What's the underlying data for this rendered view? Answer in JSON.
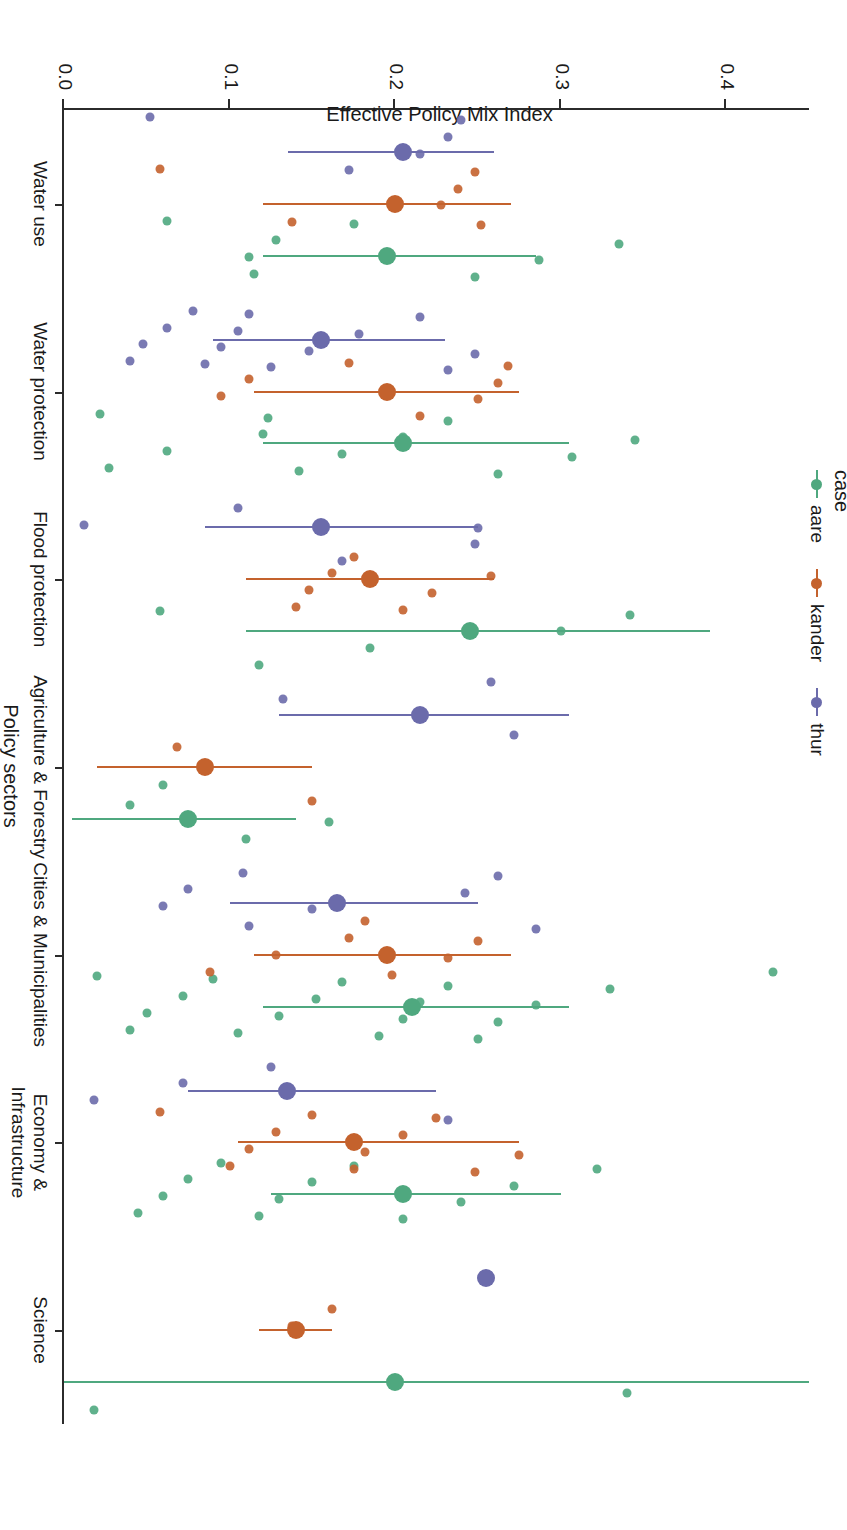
{
  "figure": {
    "xaxis_title": "Policy sectors",
    "yaxis_title": "Effective Policy Mix Index",
    "ytick_labels": [
      "0.4",
      "0.3",
      "0.2",
      "0.1",
      "0.0"
    ],
    "ytick_values": [
      0.4,
      0.3,
      0.2,
      0.1,
      0.0
    ]
  },
  "legend": {
    "title": "case",
    "items": [
      {
        "label": "aare",
        "color": "#4fa87f"
      },
      {
        "label": "kander",
        "color": "#c4622d"
      },
      {
        "label": "thur",
        "color": "#6b6bab"
      }
    ]
  },
  "chart_data": {
    "type": "scatter",
    "title": "",
    "xlabel": "Policy sectors",
    "ylabel": "Effective Policy Mix Index",
    "ylim": [
      0.0,
      0.45
    ],
    "grid": false,
    "legend_position": "left",
    "legend_title": "case",
    "categories": [
      "Water use",
      "Water protection",
      "Flood protection",
      "Agriculture & Forestry",
      "Cities & Municipalities",
      "Economy & Infrastructure",
      "Science"
    ],
    "series": [
      {
        "name": "aare",
        "color": "#4fa87f",
        "means": [
          0.195,
          0.205,
          0.245,
          0.075,
          0.21,
          0.205,
          0.2
        ],
        "ci_low": [
          0.12,
          0.12,
          0.11,
          0.005,
          0.12,
          0.125,
          0.0
        ],
        "ci_high": [
          0.285,
          0.305,
          0.39,
          0.14,
          0.305,
          0.3,
          0.45
        ]
      },
      {
        "name": "kander",
        "color": "#c4622d",
        "means": [
          0.2,
          0.195,
          0.185,
          0.085,
          0.195,
          0.175,
          0.14
        ],
        "ci_low": [
          0.12,
          0.115,
          0.11,
          0.02,
          0.115,
          0.105,
          0.118
        ],
        "ci_high": [
          0.27,
          0.275,
          0.26,
          0.15,
          0.27,
          0.275,
          0.162
        ]
      },
      {
        "name": "thur",
        "color": "#6b6bab",
        "means": [
          0.205,
          0.155,
          0.155,
          0.215,
          0.165,
          0.135,
          0.255
        ],
        "ci_low": [
          0.135,
          0.09,
          0.085,
          0.13,
          0.1,
          0.075,
          0.255
        ],
        "ci_high": [
          0.26,
          0.23,
          0.25,
          0.305,
          0.25,
          0.225,
          0.255
        ]
      }
    ],
    "points": {
      "aare": [
        [
          0,
          0.062
        ],
        [
          0,
          0.115
        ],
        [
          0,
          0.112
        ],
        [
          0,
          0.128
        ],
        [
          0,
          0.175
        ],
        [
          0,
          0.248
        ],
        [
          0,
          0.287
        ],
        [
          0,
          0.335
        ],
        [
          1,
          0.022
        ],
        [
          1,
          0.027
        ],
        [
          1,
          0.062
        ],
        [
          1,
          0.12
        ],
        [
          1,
          0.123
        ],
        [
          1,
          0.142
        ],
        [
          1,
          0.168
        ],
        [
          1,
          0.205
        ],
        [
          1,
          0.232
        ],
        [
          1,
          0.262
        ],
        [
          1,
          0.307
        ],
        [
          1,
          0.345
        ],
        [
          2,
          0.058
        ],
        [
          2,
          0.118
        ],
        [
          2,
          0.185
        ],
        [
          2,
          0.3
        ],
        [
          2,
          0.342
        ],
        [
          3,
          0.06
        ],
        [
          3,
          0.11
        ],
        [
          3,
          0.16
        ],
        [
          3,
          0.04
        ],
        [
          4,
          0.02
        ],
        [
          4,
          0.04
        ],
        [
          4,
          0.05
        ],
        [
          4,
          0.072
        ],
        [
          4,
          0.09
        ],
        [
          4,
          0.105
        ],
        [
          4,
          0.13
        ],
        [
          4,
          0.152
        ],
        [
          4,
          0.168
        ],
        [
          4,
          0.19
        ],
        [
          4,
          0.205
        ],
        [
          4,
          0.215
        ],
        [
          4,
          0.232
        ],
        [
          4,
          0.25
        ],
        [
          4,
          0.262
        ],
        [
          4,
          0.285
        ],
        [
          4,
          0.33
        ],
        [
          4,
          0.428
        ],
        [
          5,
          0.045
        ],
        [
          5,
          0.06
        ],
        [
          5,
          0.075
        ],
        [
          5,
          0.095
        ],
        [
          5,
          0.118
        ],
        [
          5,
          0.13
        ],
        [
          5,
          0.15
        ],
        [
          5,
          0.175
        ],
        [
          5,
          0.205
        ],
        [
          5,
          0.24
        ],
        [
          5,
          0.272
        ],
        [
          5,
          0.322
        ],
        [
          6,
          0.018
        ],
        [
          6,
          0.34
        ]
      ],
      "kander": [
        [
          0,
          0.058
        ],
        [
          0,
          0.138
        ],
        [
          0,
          0.228
        ],
        [
          0,
          0.238
        ],
        [
          0,
          0.248
        ],
        [
          0,
          0.252
        ],
        [
          1,
          0.095
        ],
        [
          1,
          0.112
        ],
        [
          1,
          0.172
        ],
        [
          1,
          0.215
        ],
        [
          1,
          0.25
        ],
        [
          1,
          0.262
        ],
        [
          1,
          0.268
        ],
        [
          2,
          0.14
        ],
        [
          2,
          0.148
        ],
        [
          2,
          0.162
        ],
        [
          2,
          0.175
        ],
        [
          2,
          0.205
        ],
        [
          2,
          0.222
        ],
        [
          2,
          0.258
        ],
        [
          3,
          0.068
        ],
        [
          3,
          0.15
        ],
        [
          4,
          0.088
        ],
        [
          4,
          0.128
        ],
        [
          4,
          0.172
        ],
        [
          4,
          0.182
        ],
        [
          4,
          0.198
        ],
        [
          4,
          0.232
        ],
        [
          4,
          0.25
        ],
        [
          5,
          0.058
        ],
        [
          5,
          0.1
        ],
        [
          5,
          0.112
        ],
        [
          5,
          0.128
        ],
        [
          5,
          0.15
        ],
        [
          5,
          0.175
        ],
        [
          5,
          0.182
        ],
        [
          5,
          0.205
        ],
        [
          5,
          0.225
        ],
        [
          5,
          0.248
        ],
        [
          5,
          0.275
        ],
        [
          6,
          0.138
        ],
        [
          6,
          0.162
        ]
      ],
      "thur": [
        [
          0,
          0.052
        ],
        [
          0,
          0.172
        ],
        [
          0,
          0.215
        ],
        [
          0,
          0.232
        ],
        [
          0,
          0.24
        ],
        [
          1,
          0.04
        ],
        [
          1,
          0.048
        ],
        [
          1,
          0.062
        ],
        [
          1,
          0.078
        ],
        [
          1,
          0.085
        ],
        [
          1,
          0.095
        ],
        [
          1,
          0.105
        ],
        [
          1,
          0.112
        ],
        [
          1,
          0.125
        ],
        [
          1,
          0.148
        ],
        [
          1,
          0.178
        ],
        [
          1,
          0.215
        ],
        [
          1,
          0.232
        ],
        [
          1,
          0.248
        ],
        [
          2,
          0.012
        ],
        [
          2,
          0.105
        ],
        [
          2,
          0.168
        ],
        [
          2,
          0.248
        ],
        [
          2,
          0.25
        ],
        [
          3,
          0.132
        ],
        [
          3,
          0.258
        ],
        [
          3,
          0.272
        ],
        [
          4,
          0.06
        ],
        [
          4,
          0.075
        ],
        [
          4,
          0.108
        ],
        [
          4,
          0.112
        ],
        [
          4,
          0.15
        ],
        [
          4,
          0.242
        ],
        [
          4,
          0.262
        ],
        [
          4,
          0.285
        ],
        [
          5,
          0.018
        ],
        [
          5,
          0.072
        ],
        [
          5,
          0.125
        ],
        [
          5,
          0.232
        ]
      ]
    }
  }
}
